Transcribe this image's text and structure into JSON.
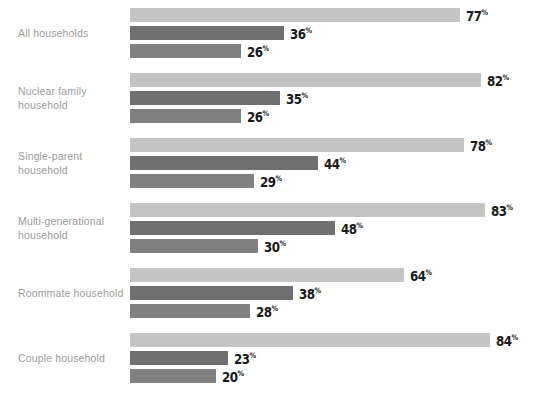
{
  "chart_data": {
    "type": "bar",
    "orientation": "horizontal",
    "title": "",
    "subtitle": "",
    "xlabel": "",
    "ylabel": "",
    "xlim": [
      0,
      100
    ],
    "grid": false,
    "legend": "none",
    "value_suffix": "%",
    "categories": [
      "All households",
      "Nuclear family household",
      "Single-parent household",
      "Multi-generational household",
      "Roommate household",
      "Couple household"
    ],
    "category_lines": [
      [
        "All households"
      ],
      [
        "Nuclear family",
        "household"
      ],
      [
        "Single-parent",
        "household"
      ],
      [
        "Multi-generational",
        "household"
      ],
      [
        "Roommate household"
      ],
      [
        "Couple household"
      ]
    ],
    "series": [
      {
        "name": "series-1",
        "color": "#c4c4c4",
        "values": [
          77,
          82,
          78,
          83,
          64,
          84
        ]
      },
      {
        "name": "series-2",
        "color": "#6f6f6f",
        "values": [
          36,
          35,
          44,
          48,
          38,
          23
        ]
      },
      {
        "name": "series-3",
        "color": "#808080",
        "values": [
          26,
          26,
          29,
          30,
          28,
          20
        ]
      }
    ]
  },
  "style": {
    "background": "#ffffff",
    "label_color": "#9b9b9b",
    "value_color": "#1a1a1a",
    "px_per_percent": 4.28
  }
}
